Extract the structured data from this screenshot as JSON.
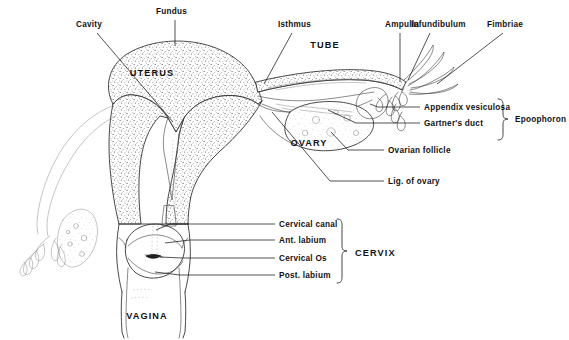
{
  "figure": {
    "background_color": "#ffffff",
    "ink_color": "#1a1a1a"
  },
  "structure_labels": [
    {
      "id": "uterus",
      "text": "UTERUS",
      "x": 152,
      "y": 76,
      "style": "caps"
    },
    {
      "id": "tube",
      "text": "TUBE",
      "x": 325,
      "y": 48,
      "style": "caps"
    },
    {
      "id": "ovary",
      "text": "OVARY",
      "x": 309,
      "y": 146,
      "style": "caps"
    },
    {
      "id": "cervix",
      "text": "CERVIX",
      "x": 355,
      "y": 256,
      "style": "caps"
    },
    {
      "id": "vagina",
      "text": "VAGINA",
      "x": 147,
      "y": 319,
      "style": "caps"
    },
    {
      "id": "epoophoron",
      "text": "Epoophoron",
      "x": 515,
      "y": 122,
      "style": "plain"
    }
  ],
  "callouts": [
    {
      "id": "cavity",
      "text": "Cavity",
      "x": 76,
      "y": 27,
      "anchor": "start"
    },
    {
      "id": "fundus",
      "text": "Fundus",
      "x": 156,
      "y": 14,
      "anchor": "start"
    },
    {
      "id": "isthmus",
      "text": "Isthmus",
      "x": 278,
      "y": 27,
      "anchor": "start"
    },
    {
      "id": "ampulla",
      "text": "Ampulla",
      "x": 385,
      "y": 27,
      "anchor": "start"
    },
    {
      "id": "infundibulum",
      "text": "Infundibulum",
      "x": 411,
      "y": 27,
      "anchor": "start"
    },
    {
      "id": "fimbriae",
      "text": "Fimbriae",
      "x": 487,
      "y": 27,
      "anchor": "start"
    },
    {
      "id": "appendix-vesiculosa",
      "text": "Appendix vesiculosa",
      "x": 424,
      "y": 110,
      "anchor": "start"
    },
    {
      "id": "gartners-duct",
      "text": "Gartner's duct",
      "x": 424,
      "y": 126,
      "anchor": "start"
    },
    {
      "id": "ovarian-follicle",
      "text": "Ovarian follicle",
      "x": 388,
      "y": 153,
      "anchor": "start"
    },
    {
      "id": "lig-of-ovary",
      "text": "Lig. of ovary",
      "x": 388,
      "y": 184,
      "anchor": "start"
    },
    {
      "id": "cervical-canal",
      "text": "Cervical canal",
      "x": 279,
      "y": 227,
      "anchor": "start"
    },
    {
      "id": "ant-labium",
      "text": "Ant. labium",
      "x": 279,
      "y": 243,
      "anchor": "start"
    },
    {
      "id": "cervical-os",
      "text": "Cervical Os",
      "x": 279,
      "y": 261,
      "anchor": "start"
    },
    {
      "id": "post-labium",
      "text": "Post. labium",
      "x": 279,
      "y": 278,
      "anchor": "start"
    }
  ],
  "brackets": [
    {
      "id": "epoophoron-bracket",
      "groups": [
        "Appendix vesiculosa",
        "Gartner's duct"
      ]
    },
    {
      "id": "cervix-bracket",
      "groups": [
        "Cervical canal",
        "Ant. labium",
        "Cervical Os",
        "Post. labium"
      ]
    }
  ]
}
